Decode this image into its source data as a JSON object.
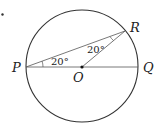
{
  "diagram": {
    "type": "circle-geometry",
    "points": {
      "P": {
        "label": "P"
      },
      "Q": {
        "label": "Q"
      },
      "O": {
        "label": "O"
      },
      "R": {
        "label": "R"
      }
    },
    "angles": {
      "angle_RPQ": "20°",
      "angle_PRO": "20°"
    },
    "stroke_color": "#333333"
  }
}
